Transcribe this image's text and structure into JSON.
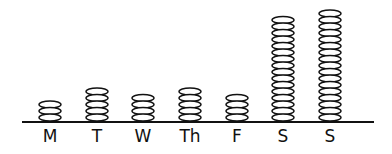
{
  "chart_data": {
    "type": "pictograph",
    "title": "",
    "xlabel": "",
    "ylabel": "",
    "unit_icon": "stacked-coin-ellipse",
    "categories": [
      "M",
      "T",
      "W",
      "Th",
      "F",
      "S",
      "S"
    ],
    "values": [
      3,
      5,
      4,
      5,
      4,
      16,
      17
    ],
    "grid": false,
    "legend": null
  },
  "layout": {
    "baseline_y": 122,
    "axis_x1": 22,
    "axis_x2": 374,
    "label_y": 142,
    "centers": [
      50,
      97,
      143,
      190,
      237,
      283,
      330
    ],
    "ellipse_rx": 11,
    "ellipse_ry": 3.5,
    "pitch": 6.5,
    "bottom_center_y": 117.5
  }
}
